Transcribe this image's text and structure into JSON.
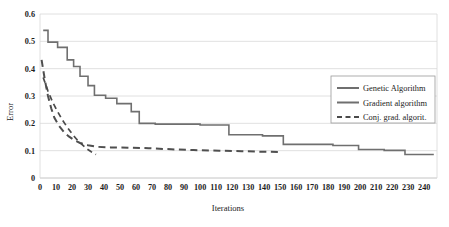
{
  "chart_data": {
    "type": "line",
    "title": "",
    "xlabel": "Iterations",
    "ylabel": "Error",
    "xlim": [
      0,
      248
    ],
    "ylim": [
      0,
      0.6
    ],
    "grid": true,
    "legend_position": "right-center",
    "xticks": [
      0,
      10,
      20,
      30,
      40,
      50,
      60,
      70,
      80,
      90,
      100,
      110,
      120,
      130,
      140,
      150,
      160,
      170,
      180,
      190,
      200,
      210,
      220,
      230,
      240
    ],
    "yticks": [
      0,
      0.1,
      0.2,
      0.3,
      0.4,
      0.5,
      0.6
    ],
    "ytick_labels": [
      "0",
      "0.1",
      "0.2",
      "0.3",
      "0.4",
      "0.5",
      "0.6"
    ],
    "series": [
      {
        "name": "Genetic Algorithm",
        "style": "solid",
        "color": "#6f6f6f",
        "points": [
          [
            2,
            0.54
          ],
          [
            5,
            0.54
          ],
          [
            5,
            0.497
          ],
          [
            11,
            0.497
          ],
          [
            11,
            0.478
          ],
          [
            17,
            0.478
          ],
          [
            17,
            0.432
          ],
          [
            21,
            0.432
          ],
          [
            21,
            0.408
          ],
          [
            25,
            0.408
          ],
          [
            25,
            0.372
          ],
          [
            30,
            0.372
          ],
          [
            30,
            0.338
          ],
          [
            34,
            0.338
          ],
          [
            34,
            0.303
          ],
          [
            41,
            0.303
          ],
          [
            41,
            0.292
          ],
          [
            48,
            0.292
          ],
          [
            48,
            0.272
          ],
          [
            57,
            0.272
          ],
          [
            57,
            0.243
          ],
          [
            62,
            0.243
          ],
          [
            62,
            0.2
          ],
          [
            72,
            0.2
          ],
          [
            72,
            0.197
          ],
          [
            100,
            0.197
          ],
          [
            100,
            0.194
          ],
          [
            118,
            0.194
          ],
          [
            118,
            0.158
          ],
          [
            139,
            0.158
          ],
          [
            139,
            0.154
          ],
          [
            152,
            0.154
          ],
          [
            152,
            0.123
          ],
          [
            183,
            0.123
          ],
          [
            183,
            0.119
          ],
          [
            199,
            0.119
          ],
          [
            199,
            0.104
          ],
          [
            215,
            0.104
          ],
          [
            215,
            0.101
          ],
          [
            228,
            0.101
          ],
          [
            228,
            0.086
          ],
          [
            246,
            0.086
          ]
        ]
      },
      {
        "name": "Gradient algorithm",
        "style": "dashed-long",
        "color": "#4f4f4f",
        "points": [
          [
            1,
            0.432
          ],
          [
            3,
            0.36
          ],
          [
            5,
            0.3
          ],
          [
            7,
            0.255
          ],
          [
            9,
            0.22
          ],
          [
            12,
            0.19
          ],
          [
            15,
            0.168
          ],
          [
            18,
            0.152
          ],
          [
            21,
            0.14
          ],
          [
            25,
            0.128
          ],
          [
            30,
            0.12
          ],
          [
            36,
            0.114
          ],
          [
            44,
            0.112
          ],
          [
            55,
            0.111
          ],
          [
            68,
            0.109
          ],
          [
            82,
            0.105
          ],
          [
            96,
            0.102
          ],
          [
            112,
            0.1
          ],
          [
            126,
            0.098
          ],
          [
            140,
            0.096
          ],
          [
            150,
            0.095
          ]
        ]
      },
      {
        "name": "Conj. grad. algorit.",
        "style": "dashed-short",
        "color": "#4a4a4a",
        "points": [
          [
            2,
            0.368
          ],
          [
            5,
            0.318
          ],
          [
            8,
            0.276
          ],
          [
            11,
            0.243
          ],
          [
            14,
            0.212
          ],
          [
            17,
            0.186
          ],
          [
            20,
            0.162
          ],
          [
            23,
            0.141
          ],
          [
            26,
            0.124
          ],
          [
            29,
            0.108
          ],
          [
            32,
            0.096
          ],
          [
            35,
            0.086
          ]
        ]
      }
    ]
  },
  "legend": {
    "entries": [
      {
        "label": "Genetic Algorithm",
        "style": "solid"
      },
      {
        "label": "Gradient algorithm",
        "style": "solid"
      },
      {
        "label": "Conj. grad. algorit.",
        "style": "dashed"
      }
    ]
  },
  "axis": {
    "y_title": "Error",
    "x_title": "Iterations"
  }
}
